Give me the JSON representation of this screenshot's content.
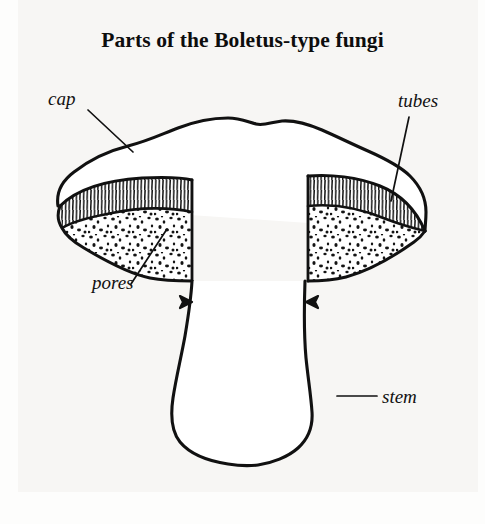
{
  "figure": {
    "title": "Parts of the Boletus-type fungi",
    "background_color": "#f7f6f4",
    "ink_color": "#111111",
    "labels": [
      {
        "id": "cap",
        "text": "cap",
        "icon": "leader-line-icon",
        "leader_from": [
          88,
          110
        ],
        "leader_to": [
          133,
          152
        ]
      },
      {
        "id": "tubes",
        "text": "tubes",
        "icon": "leader-line-icon",
        "leader_from": [
          409,
          117
        ],
        "leader_to": [
          391,
          201
        ]
      },
      {
        "id": "pores",
        "text": "pores",
        "icon": "leader-line-icon",
        "leader_from": [
          131,
          284
        ],
        "leader_to": [
          167,
          229
        ]
      },
      {
        "id": "stem",
        "text": "stem",
        "icon": "leader-line-icon",
        "leader_from": [
          337,
          396
        ],
        "leader_to": [
          377,
          396
        ]
      }
    ],
    "parts": [
      {
        "name": "cap",
        "texture": "plain-outline"
      },
      {
        "name": "tubes",
        "texture": "vertical-hatching"
      },
      {
        "name": "pores",
        "texture": "stipple-dots"
      },
      {
        "name": "stem",
        "texture": "plain-outline"
      }
    ]
  }
}
